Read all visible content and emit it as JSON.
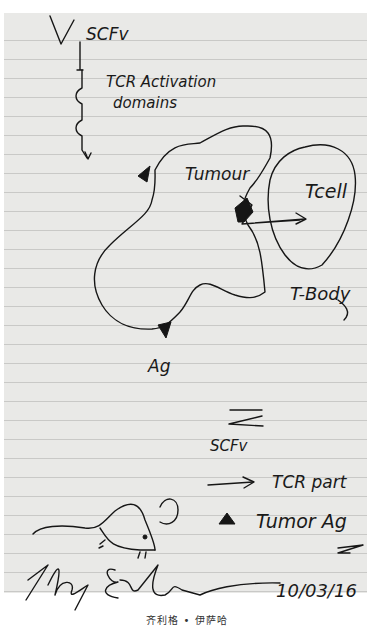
{
  "image": {
    "description": "Handwritten sketch on lined notepaper illustrating a T-body (CAR T-cell) concept",
    "labels": {
      "scfv_top": "SCFv",
      "tcr_activation_line1": "TCR Activation",
      "tcr_activation_line2": "domains",
      "tumour": "Tumour",
      "tcell": "Tcell",
      "tbody": "T-Body",
      "ag": "Ag",
      "legend_scfv": "SCFv",
      "legend_tcr_part": "TCR part",
      "legend_tumor_ag": "Tumor Ag",
      "signature": "Zelig Eshhar",
      "date": "10/03/16"
    },
    "legend": [
      {
        "symbol": "scfv-fork-icon",
        "label": "SCFv"
      },
      {
        "symbol": "arrow-icon",
        "label": "TCR part"
      },
      {
        "symbol": "triangle-icon",
        "label": "Tumor Ag"
      }
    ],
    "caption": "齐利格 • 伊萨哈",
    "colors": {
      "paper": "#e9e9e7",
      "rule_line": "#c9c9c7",
      "ink": "#161616",
      "background": "#ffffff"
    }
  }
}
